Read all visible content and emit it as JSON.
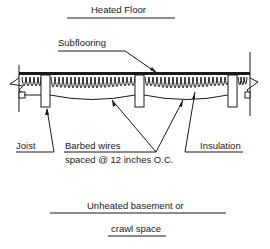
{
  "title": "Heated Floor",
  "labels": {
    "subflooring": "Subflooring",
    "joist": "Joist",
    "barbed_wires_line1": "Barbed wires",
    "barbed_wires_line2": "spaced @ 12 inches O.C.",
    "insulation": "Insulation"
  },
  "bottom_caption": {
    "line1": "Unheated basement or",
    "line2": "crawl space"
  },
  "colors": {
    "ink": "#1a1a1a",
    "background": "#ffffff"
  }
}
